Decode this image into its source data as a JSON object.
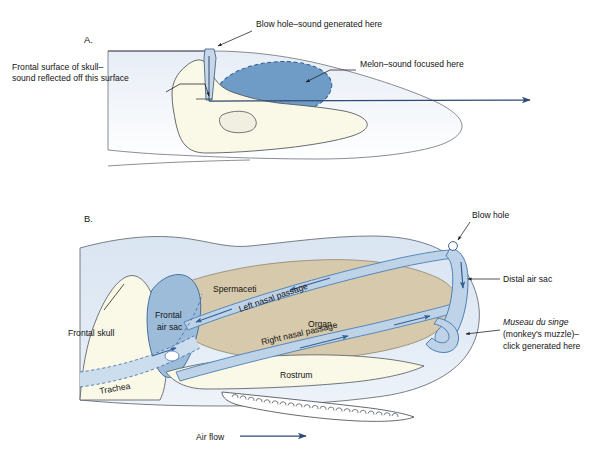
{
  "figure": {
    "type": "anatomical-diagram",
    "panels": [
      {
        "id": "A",
        "label": "A.",
        "annotations": [
          {
            "name": "blow-hole-sound",
            "text": "Blow hole–sound generated here"
          },
          {
            "name": "frontal-surface-skull",
            "line1": "Frontal surface of skull–",
            "line2": "sound reflected off this surface"
          },
          {
            "name": "melon-sound-focused",
            "text": "Melon–sound focused here"
          }
        ]
      },
      {
        "id": "B",
        "label": "B.",
        "annotations": [
          {
            "name": "blow-hole",
            "text": "Blow hole"
          },
          {
            "name": "distal-air-sac",
            "text": "Distal air sac"
          },
          {
            "name": "museau-du-singe",
            "line1": "Museau du singe",
            "line2": "(monkey's muzzle)–",
            "line3": "click generated here"
          },
          {
            "name": "frontal-skull",
            "text": "Frontal skull"
          },
          {
            "name": "frontal-air-sac",
            "line1": "Frontal",
            "line2": "air sac"
          },
          {
            "name": "spermaceti",
            "text": "Spermaceti"
          },
          {
            "name": "organ",
            "text": "Organ"
          },
          {
            "name": "left-nasal-passage",
            "text": "Left nasal passage"
          },
          {
            "name": "right-nasal-passage",
            "text": "Right nasal passage"
          },
          {
            "name": "rostrum",
            "text": "Rostrum"
          },
          {
            "name": "trachea",
            "text": "Trachea"
          },
          {
            "name": "air-flow",
            "text": "Air flow"
          }
        ]
      }
    ]
  },
  "colors": {
    "melon_fill": "#6f9cc6",
    "melon_outline": "#2f5d8f",
    "skull_fill": "#faf8e6",
    "head_body_a": "#eef2f8",
    "head_body_b": "#dbe5f1",
    "spermaceti_fill": "#d7c9ab",
    "frontal_air_sac_fill": "#9dbcda",
    "nasal_passage_fill": "#bed3e8",
    "nasal_passage_stroke": "#4a7fb5",
    "arrow_blue": "#2d4a72",
    "outline_gray": "#44484f",
    "background": "#ffffff"
  }
}
